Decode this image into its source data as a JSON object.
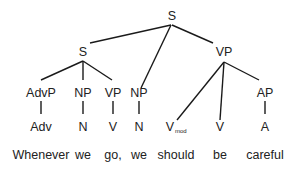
{
  "diagram": {
    "type": "syntax-tree",
    "sentence": "Whenever we go, we should be careful",
    "nodes": {
      "root": {
        "label": "S",
        "x": 172,
        "y": 20
      },
      "s_sub": {
        "label": "S",
        "x": 83,
        "y": 56
      },
      "vp_main": {
        "label": "VP",
        "x": 224,
        "y": 56
      },
      "advp": {
        "label": "AdvP",
        "x": 41,
        "y": 97
      },
      "np1": {
        "label": "NP",
        "x": 83,
        "y": 97
      },
      "vp1": {
        "label": "VP",
        "x": 113,
        "y": 97
      },
      "np2": {
        "label": "NP",
        "x": 139,
        "y": 97
      },
      "ap": {
        "label": "AP",
        "x": 265,
        "y": 97
      },
      "adv": {
        "label": "Adv",
        "x": 41,
        "y": 138
      },
      "n1": {
        "label": "N",
        "x": 83,
        "y": 138
      },
      "v1": {
        "label": "V",
        "x": 113,
        "y": 138
      },
      "n2": {
        "label": "N",
        "x": 139,
        "y": 138
      },
      "vmod": {
        "label": "V",
        "subscript": "mod",
        "x": 172,
        "y": 138
      },
      "v2": {
        "label": "V",
        "x": 220,
        "y": 138
      },
      "a": {
        "label": "A",
        "x": 265,
        "y": 138
      }
    },
    "words": [
      {
        "text": "Whenever",
        "x": 41
      },
      {
        "text": "we",
        "x": 83
      },
      {
        "text": "go,",
        "x": 113
      },
      {
        "text": "we",
        "x": 139
      },
      {
        "text": "should",
        "x": 176
      },
      {
        "text": "be",
        "x": 220
      },
      {
        "text": "careful",
        "x": 265
      }
    ],
    "words_y": 162
  }
}
